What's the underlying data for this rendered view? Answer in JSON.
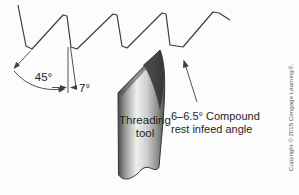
{
  "diagram": {
    "annotations": {
      "thread_flank_angle": "45°",
      "tool_relief_angle": "7°",
      "tool_label_line1": "Threading",
      "tool_label_line2": "tool",
      "infeed_label_line1": "6–6.5° Compound",
      "infeed_label_line2": "rest infeed angle"
    },
    "copyright": "Copyright © 2015 Cengage Learning®.",
    "angles": {
      "thread_flank_deg": 45,
      "tool_relief_deg": 7,
      "compound_rest_infeed_deg_range": "6–6.5"
    },
    "colors": {
      "background": "#fcfcfc",
      "line": "#3f3f3f",
      "label_text": "#1f1f1f",
      "copyright_text": "#5a5a5a",
      "tool_dark": "#2e2e2e",
      "tool_light": "#efefef"
    }
  }
}
